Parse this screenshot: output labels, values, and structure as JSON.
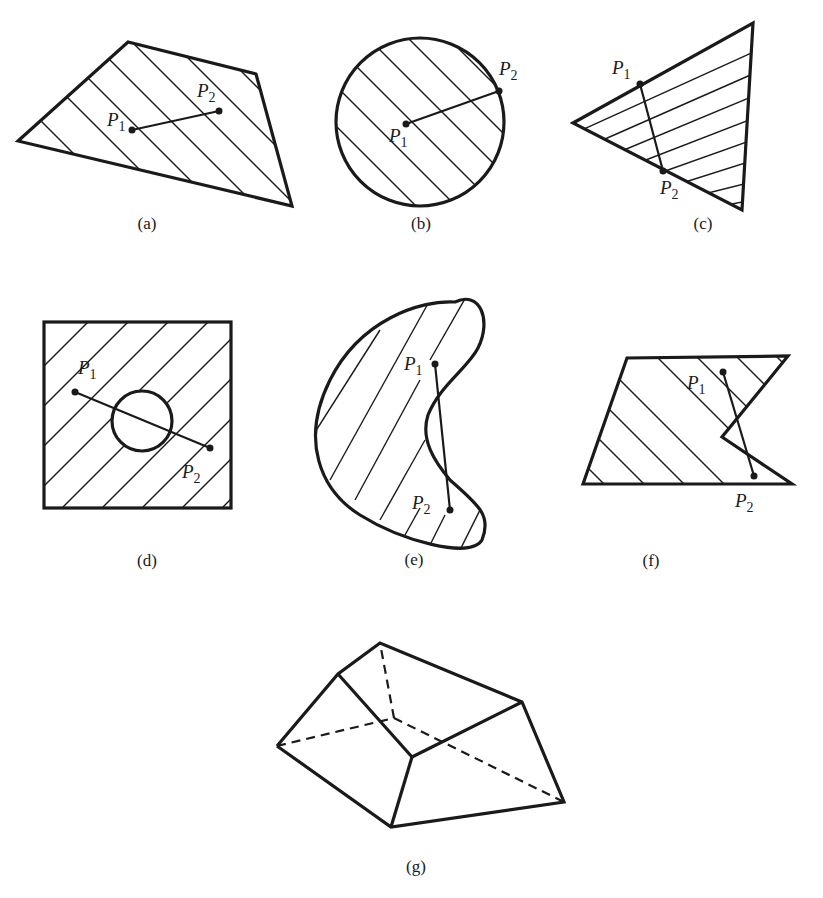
{
  "figure": {
    "panels": [
      {
        "id": "a",
        "caption": "(a)",
        "shape": "convex quadrilateral",
        "p1": "P",
        "p1_sub": "1",
        "p2": "P",
        "p2_sub": "2"
      },
      {
        "id": "b",
        "caption": "(b)",
        "shape": "disk",
        "p1": "P",
        "p1_sub": "1",
        "p2": "P",
        "p2_sub": "2"
      },
      {
        "id": "c",
        "caption": "(c)",
        "shape": "triangle",
        "p1": "P",
        "p1_sub": "1",
        "p2": "P",
        "p2_sub": "2"
      },
      {
        "id": "d",
        "caption": "(d)",
        "shape": "square with circular hole",
        "p1": "P",
        "p1_sub": "1",
        "p2": "P",
        "p2_sub": "2"
      },
      {
        "id": "e",
        "caption": "(e)",
        "shape": "kidney-shaped region",
        "p1": "P",
        "p1_sub": "1",
        "p2": "P",
        "p2_sub": "2"
      },
      {
        "id": "f",
        "caption": "(f)",
        "shape": "notched quadrilateral",
        "p1": "P",
        "p1_sub": "1",
        "p2": "P",
        "p2_sub": "2"
      },
      {
        "id": "g",
        "caption": "(g)",
        "shape": "convex polyhedron (hidden edges dashed)"
      }
    ]
  }
}
